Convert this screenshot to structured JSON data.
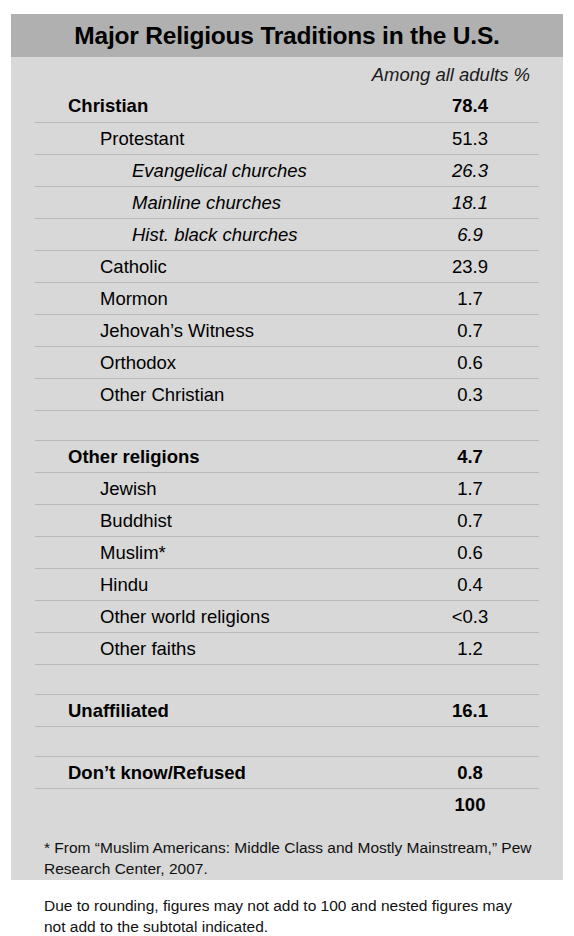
{
  "card": {
    "title": "Major Religious Traditions in the U.S.",
    "column_header": "Among all adults %"
  },
  "colors": {
    "page_background": "#ffffff",
    "card_background": "#d8d8d8",
    "title_band": "#b0b0b0",
    "rule": "#b9b9b9",
    "text": "#000000"
  },
  "chart_data": {
    "type": "table",
    "title": "Major Religious Traditions in the U.S.",
    "xlabel": "",
    "ylabel": "Among all adults %",
    "columns": [
      "Tradition",
      "Among all adults %"
    ],
    "categories": [
      "Christian",
      "Protestant",
      "Evangelical churches",
      "Mainline churches",
      "Hist. black churches",
      "Catholic",
      "Mormon",
      "Jehovah's Witness",
      "Orthodox",
      "Other Christian",
      "Other religions",
      "Jewish",
      "Buddhist",
      "Muslim*",
      "Hindu",
      "Other world religions",
      "Other faiths",
      "Unaffiliated",
      "Don't know/Refused",
      ""
    ],
    "values": [
      78.4,
      51.3,
      26.3,
      18.1,
      6.9,
      23.9,
      1.7,
      0.7,
      0.6,
      0.3,
      4.7,
      1.7,
      0.7,
      0.6,
      0.4,
      0.3,
      1.2,
      16.1,
      0.8,
      100
    ]
  },
  "rows": [
    {
      "label": "Christian",
      "value": "78.4",
      "level": 0,
      "bold": true,
      "italic": false,
      "rule": false
    },
    {
      "label": "Protestant",
      "value": "51.3",
      "level": 1,
      "bold": false,
      "italic": false,
      "rule": true
    },
    {
      "label": "Evangelical churches",
      "value": "26.3",
      "level": 2,
      "bold": false,
      "italic": true,
      "rule": true
    },
    {
      "label": "Mainline churches",
      "value": "18.1",
      "level": 2,
      "bold": false,
      "italic": true,
      "rule": true
    },
    {
      "label": "Hist. black churches",
      "value": "6.9",
      "level": 2,
      "bold": false,
      "italic": true,
      "rule": true
    },
    {
      "label": "Catholic",
      "value": "23.9",
      "level": 1,
      "bold": false,
      "italic": false,
      "rule": true
    },
    {
      "label": "Mormon",
      "value": "1.7",
      "level": 1,
      "bold": false,
      "italic": false,
      "rule": true
    },
    {
      "label": "Jehovah’s Witness",
      "value": "0.7",
      "level": 1,
      "bold": false,
      "italic": false,
      "rule": true
    },
    {
      "label": "Orthodox",
      "value": "0.6",
      "level": 1,
      "bold": false,
      "italic": false,
      "rule": true
    },
    {
      "label": "Other Christian",
      "value": "0.3",
      "level": 1,
      "bold": false,
      "italic": false,
      "rule": true
    },
    {
      "label": "",
      "value": "",
      "level": 0,
      "bold": false,
      "italic": false,
      "rule": true,
      "spacer": true
    },
    {
      "label": "Other religions",
      "value": "4.7",
      "level": 0,
      "bold": true,
      "italic": false,
      "rule": true
    },
    {
      "label": "Jewish",
      "value": "1.7",
      "level": 1,
      "bold": false,
      "italic": false,
      "rule": true
    },
    {
      "label": "Buddhist",
      "value": "0.7",
      "level": 1,
      "bold": false,
      "italic": false,
      "rule": true
    },
    {
      "label": "Muslim*",
      "value": "0.6",
      "level": 1,
      "bold": false,
      "italic": false,
      "rule": true
    },
    {
      "label": "Hindu",
      "value": "0.4",
      "level": 1,
      "bold": false,
      "italic": false,
      "rule": true
    },
    {
      "label": "Other world religions",
      "value": "<0.3",
      "level": 1,
      "bold": false,
      "italic": false,
      "rule": true
    },
    {
      "label": "Other faiths",
      "value": "1.2",
      "level": 1,
      "bold": false,
      "italic": false,
      "rule": true
    },
    {
      "label": "",
      "value": "",
      "level": 0,
      "bold": false,
      "italic": false,
      "rule": true,
      "spacer": true
    },
    {
      "label": "Unaffiliated",
      "value": "16.1",
      "level": 0,
      "bold": true,
      "italic": false,
      "rule": true
    },
    {
      "label": "",
      "value": "",
      "level": 0,
      "bold": false,
      "italic": false,
      "rule": true,
      "spacer": true
    },
    {
      "label": "Don’t know/Refused",
      "value": "0.8",
      "level": 0,
      "bold": true,
      "italic": false,
      "rule": true
    },
    {
      "label": "",
      "value": "100",
      "level": 0,
      "bold": true,
      "italic": false,
      "rule": true
    }
  ],
  "footnotes": [
    "* From “Muslim Americans: Middle Class and Mostly Mainstream,” Pew Research Center, 2007.",
    "Due to rounding, figures may not add to 100 and nested figures may not add to the subtotal indicated."
  ]
}
